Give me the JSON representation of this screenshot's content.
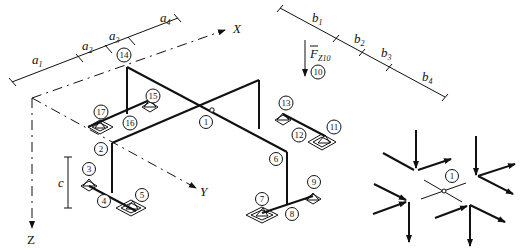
{
  "axes": {
    "x": "X",
    "y": "Y",
    "z": "Z"
  },
  "force_label": {
    "main": "F",
    "sub": "Z10"
  },
  "dimensions": {
    "a": [
      {
        "main": "a",
        "sub": "1"
      },
      {
        "main": "a",
        "sub": "2"
      },
      {
        "main": "a",
        "sub": "3"
      },
      {
        "main": "a",
        "sub": "4"
      }
    ],
    "b": [
      {
        "main": "b",
        "sub": "1"
      },
      {
        "main": "b",
        "sub": "2"
      },
      {
        "main": "b",
        "sub": "3"
      },
      {
        "main": "b",
        "sub": "4"
      }
    ],
    "c": "c"
  },
  "nodes": [
    "1",
    "2",
    "3",
    "4",
    "5",
    "6",
    "7",
    "8",
    "9",
    "10",
    "11",
    "12",
    "13",
    "14",
    "15",
    "16",
    "17"
  ],
  "inset": {
    "node": "1"
  },
  "colors": {
    "ink": "#111111",
    "background": "#ffffff"
  }
}
